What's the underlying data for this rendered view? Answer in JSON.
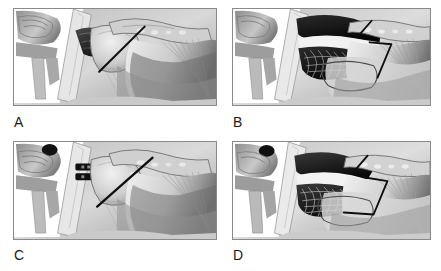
{
  "figure": {
    "background_color": "#ffffff",
    "panel_border_color": "#8a8a8a",
    "layout": "2x2 grid of grayscale anatomical illustrations",
    "label_color": "#1a1a1a"
  },
  "panels": [
    {
      "id": "A",
      "label": "A",
      "position": "top-left",
      "description": "Sagittal cross-section of the glenohumeral (shoulder) joint showing the scapula at left, rounded humeral head at center, and the fanning rotator cuff tendon to the right. A small dark defect lies at the superior glenoid margin. A single straight black pointer line runs diagonally from upper-right to lower-left across the humeral head.",
      "markers": [
        {
          "type": "pointer-line",
          "shape": "single-diagonal"
        }
      ],
      "dark_lesion": "small superior-glenoid dark cavity",
      "tone_range": [
        "#151515",
        "#f4f4f4"
      ]
    },
    {
      "id": "B",
      "label": "B",
      "position": "top-right",
      "description": "Same shoulder cross-section with a much larger black cavity at the superior joint space, filled with tangled fibrous strands. The humeral head is outlined as an open oval. A short black tick marks the upper cavity and an angular V-shaped black marker spans the joint space below.",
      "markers": [
        {
          "type": "tick-mark",
          "shape": "short-diagonal"
        },
        {
          "type": "pointer-line",
          "shape": "angular-v"
        }
      ],
      "dark_lesion": "large superior cavity with fibrous strands",
      "tone_range": [
        "#0d0d0d",
        "#f6f6f6"
      ]
    },
    {
      "id": "C",
      "label": "C",
      "position": "bottom-left",
      "description": "Shoulder cross-section with a dark rounded structure at the upper left of the scapula, a narrow black slot-shaped defect at the glenoid rim, and a prominent straight black pointer line crossing the humeral head from upper-right to lower-left.",
      "markers": [
        {
          "type": "pointer-line",
          "shape": "single-diagonal"
        }
      ],
      "dark_lesion": "narrow black slot at glenoid rim",
      "tone_range": [
        "#141414",
        "#f5f5f5"
      ]
    },
    {
      "id": "D",
      "label": "D",
      "position": "bottom-right",
      "description": "Shoulder cross-section with a broad dark mass over the superior joint and a large textured fibrous black region beneath it. The humeral head is drawn as an open outline. A short black tick sits at the top and an angular bracket-shaped black marker outlines the joint space.",
      "markers": [
        {
          "type": "tick-mark",
          "shape": "short-diagonal"
        },
        {
          "type": "pointer-line",
          "shape": "angular-bracket"
        }
      ],
      "dark_lesion": "broad dark mass with fibrous textured region",
      "tone_range": [
        "#0c0c0c",
        "#f7f7f7"
      ]
    }
  ]
}
